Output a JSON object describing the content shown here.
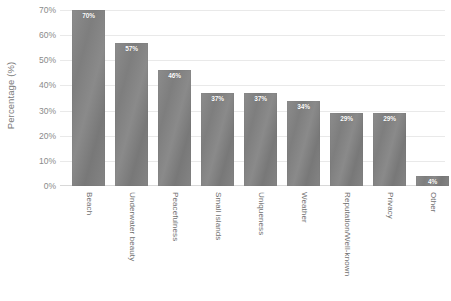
{
  "chart_data": {
    "type": "bar",
    "title": "",
    "xlabel": "",
    "ylabel": "Percentage (%)",
    "categories": [
      "Beach",
      "Underwater beauty",
      "Peacefulness",
      "Small islands",
      "Uniqueness",
      "Weather",
      "Reputation/Well-known",
      "Privacy",
      "Other"
    ],
    "values": [
      70,
      57,
      46,
      37,
      37,
      34,
      29,
      29,
      4
    ],
    "value_labels": [
      "70%",
      "57%",
      "46%",
      "37%",
      "37%",
      "34%",
      "29%",
      "29%",
      "4%"
    ],
    "ylim": [
      0,
      70
    ],
    "ytick_values": [
      0,
      10,
      20,
      30,
      40,
      50,
      60,
      70
    ],
    "ytick_labels": [
      "0%",
      "10%",
      "20%",
      "30%",
      "40%",
      "50%",
      "60%",
      "70%"
    ],
    "grid": "horizontal",
    "legend": "none",
    "bar_color": "#828282",
    "gridline_color": "#e9e9e9",
    "background_color": "#ffffff",
    "label_text_color": "#ffffff",
    "axis_text_color": "#7a7a7a"
  }
}
